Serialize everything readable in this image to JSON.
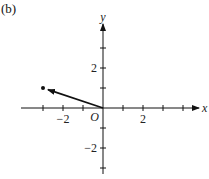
{
  "panel_label": "(b)",
  "axes": {
    "x_label": "x",
    "y_label": "y",
    "origin_label": "O",
    "x_ticks": [
      -3,
      -2,
      -1,
      1,
      2,
      3,
      4
    ],
    "y_ticks": [
      -3,
      -2,
      -1,
      1,
      2,
      3
    ],
    "x_tick_labels": [
      {
        "value": -2,
        "text": "−2"
      },
      {
        "value": 2,
        "text": "2"
      }
    ],
    "y_tick_labels": [
      {
        "value": 2,
        "text": "2"
      },
      {
        "value": -2,
        "text": "−2"
      }
    ],
    "x_range": [
      -4,
      4.8
    ],
    "y_range": [
      -3.3,
      4.2
    ]
  },
  "vector": {
    "from": [
      0,
      0
    ],
    "to": [
      -3,
      1
    ],
    "color": "#111111",
    "endpoint_dot": true
  },
  "layout": {
    "origin_px": [
      103,
      108
    ],
    "unit_px": 20
  }
}
